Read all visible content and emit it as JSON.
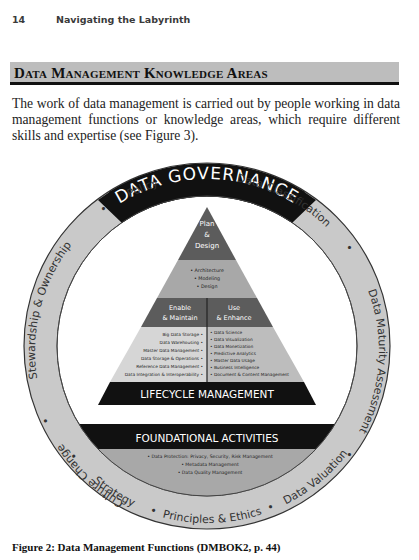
{
  "running_header": {
    "page_number": "14",
    "book_title": "Navigating the Labyrinth"
  },
  "section": {
    "title": "Data Management Knowledge Areas"
  },
  "body": {
    "paragraph": "The work of data management is carried out by people working in data management functions or knowledge areas, which require different skills and expertise (see Figure 3)."
  },
  "figure": {
    "outer_ring": {
      "title": "DATA GOVERNANCE",
      "items": [
        "Policy",
        "Stewardship & Ownership",
        "Culture Change",
        "Strategy",
        "Principles & Ethics",
        "Data Valuation",
        "Data Maturity Assessment",
        "Data Classification"
      ]
    },
    "pyramid": {
      "top": {
        "heading_lines": [
          "Plan",
          "&",
          "Design"
        ],
        "items": [
          "• Architecture",
          "• Modeling",
          "• Design"
        ]
      },
      "left": {
        "heading_lines": [
          "Enable",
          "& Maintain"
        ],
        "items": [
          "Big Data Storage •",
          "Data Warehousing •",
          "Master Data Management •",
          "Data Storage & Operations •",
          "Reference Data Management •",
          "Data Integration & Interoperability •"
        ]
      },
      "right": {
        "heading_lines": [
          "Use",
          "& Enhance"
        ],
        "items": [
          "• Data Science",
          "• Data Visualization",
          "• Data Monetization",
          "• Predictive Analytics",
          "• Master Data Usage",
          "• Business Intelligence",
          "• Document & Content Management"
        ]
      },
      "base_label": "LIFECYCLE MANAGEMENT"
    },
    "foundation": {
      "label": "FOUNDATIONAL ACTIVITIES",
      "items": [
        "• Data Protection: Privacy, Security, Risk Management",
        "• Metadata Management",
        "• Data Quality Management"
      ]
    },
    "colors": {
      "ring": "#c9c9c9",
      "governance_band": "#111111",
      "pyramid_dark": "#5c5c5c",
      "pyramid_mid": "#a8a8a8",
      "pyramid_light": "#d6d6d6",
      "bar": "#111111"
    }
  },
  "caption": "Figure 2: Data Management Functions (DMBOK2, p. 44)"
}
